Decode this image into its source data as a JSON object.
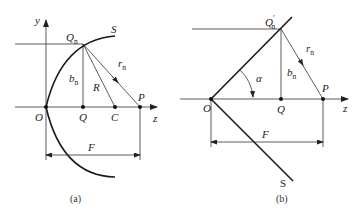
{
  "panel_a": {
    "caption": "(a)",
    "labels": {
      "y_axis": "y",
      "z_axis": "z",
      "Qn_main": "Q",
      "Qn_sub": "n",
      "S": "S",
      "rn_main": "r",
      "rn_sub": "n",
      "bn_main": "b",
      "bn_sub": "n",
      "R": "R",
      "P": "P",
      "O": "O",
      "Q": "Q",
      "C": "C",
      "F": "F"
    }
  },
  "panel_b": {
    "caption": "(b)",
    "labels": {
      "Qn_main": "Q",
      "Qn_prime": "′",
      "Qn_sub": "n",
      "rn_main": "r",
      "rn_sub": "n",
      "alpha": "α",
      "bn_main": "b",
      "bn_sub": "n",
      "P": "P",
      "O": "O",
      "Q": "Q",
      "z_axis": "z",
      "F": "F",
      "S": "S"
    }
  },
  "colors": {
    "line": "#333333",
    "curve": "#1a1a1a",
    "background": "#ffffff"
  }
}
